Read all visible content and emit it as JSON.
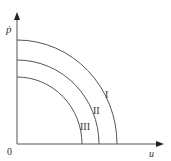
{
  "diagram": {
    "y_axis_label": "ṗ",
    "x_axis_label": "u",
    "origin_label": "0",
    "curves": [
      {
        "label": "I",
        "x_intercept": 117,
        "y_intercept": 40
      },
      {
        "label": "II",
        "x_intercept": 99,
        "y_intercept": 60
      },
      {
        "label": "III",
        "x_intercept": 82,
        "y_intercept": 77
      }
    ],
    "colors": {
      "line": "#555555",
      "text": "#333333"
    }
  }
}
